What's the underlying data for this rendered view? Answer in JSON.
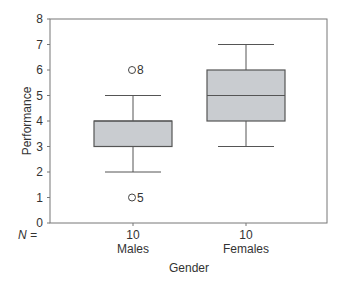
{
  "chart_data": {
    "type": "boxplot",
    "title": "",
    "xlabel": "Gender",
    "ylabel": "Performance",
    "ylim": [
      0,
      8
    ],
    "yticks": [
      0,
      1,
      2,
      3,
      4,
      5,
      6,
      7,
      8
    ],
    "n_label": "N =",
    "categories": [
      "Males",
      "Females"
    ],
    "series": [
      {
        "name": "Males",
        "n": 10,
        "whisker_low": 2,
        "q1": 3,
        "median": 4,
        "q3": 4,
        "whisker_high": 5,
        "outliers": [
          {
            "value": 6,
            "label": "8"
          },
          {
            "value": 1,
            "label": "5"
          }
        ]
      },
      {
        "name": "Females",
        "n": 10,
        "whisker_low": 3,
        "q1": 4,
        "median": 5,
        "q3": 6,
        "whisker_high": 7,
        "outliers": []
      }
    ],
    "grid": false,
    "legend": "none"
  },
  "colors": {
    "box_fill": "#c9ccd0",
    "box_stroke": "#555555",
    "axis": "#777777"
  }
}
